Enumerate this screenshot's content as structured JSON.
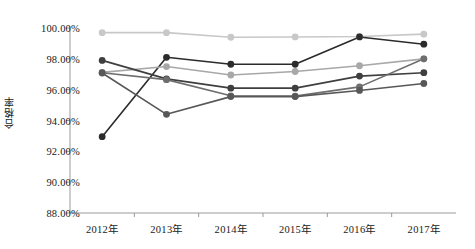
{
  "chart_data": {
    "type": "line",
    "title": "",
    "subtitle": "",
    "xlabel": "",
    "ylabel": "合格率",
    "categories": [
      "2012年",
      "2013年",
      "2014年",
      "2015年",
      "2016年",
      "2017年"
    ],
    "ylim": [
      88.0,
      100.0
    ],
    "ytick_labels": [
      "100.00%",
      "98.00%",
      "96.00%",
      "94.00%",
      "92.00%",
      "90.00%",
      "88.00%"
    ],
    "ytick_values": [
      100.0,
      98.0,
      96.0,
      94.0,
      92.0,
      90.0,
      88.0
    ],
    "yaxis_unit": "%",
    "grid": false,
    "legend": "none",
    "series": [
      {
        "name": "series-1",
        "color": "#c8c8c8",
        "values": [
          99.7,
          99.7,
          99.4,
          99.42,
          99.45,
          99.6
        ]
      },
      {
        "name": "series-2",
        "color": "#2b2b2b",
        "values": [
          92.95,
          98.1,
          97.65,
          97.65,
          99.42,
          98.95
        ]
      },
      {
        "name": "series-3",
        "color": "#a8a8a8",
        "values": [
          97.12,
          97.5,
          96.95,
          97.18,
          97.55,
          98.0
        ]
      },
      {
        "name": "series-4",
        "color": "#3f3f3f",
        "values": [
          97.9,
          96.7,
          96.1,
          96.1,
          96.88,
          97.1
        ]
      },
      {
        "name": "series-5",
        "color": "#6e6e6e",
        "values": [
          97.1,
          96.65,
          95.6,
          95.58,
          96.18,
          98.0
        ]
      },
      {
        "name": "series-6",
        "color": "#585858",
        "values": [
          97.08,
          94.4,
          95.55,
          95.55,
          95.95,
          96.4
        ]
      }
    ]
  },
  "axes": {
    "axis_color": "#9a9a9a"
  }
}
